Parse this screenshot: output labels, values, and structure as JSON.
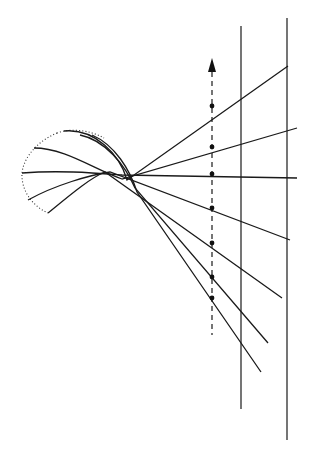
{
  "diagram": {
    "colors": {
      "stroke": "#1a1a1a",
      "background": "#ffffff"
    },
    "source_outline": "M57,133 C40,140 24,155 22,173 C21,190 32,206 48,213 M57,133 C70,128 90,130 104,138",
    "rays": [
      {
        "id": 1,
        "path": "M64,131 C95,128 120,155 127,180 L288,66"
      },
      {
        "id": 2,
        "path": "M34,148 C65,148 95,170 122,179 L297,128"
      },
      {
        "id": 3,
        "path": "M22,173 C60,170 95,173 122,175 L297,178"
      },
      {
        "id": 4,
        "path": "M28,200 C55,185 90,175 110,172 L290,240"
      },
      {
        "id": 5,
        "path": "M48,213 C70,195 90,178 105,172 L282,298"
      },
      {
        "id": 6,
        "path": "M80,135 C105,140 125,165 135,188 L268,343"
      },
      {
        "id": 7,
        "path": "M92,135 C115,145 130,170 137,192 L261,372"
      }
    ],
    "axis": {
      "x": 212,
      "y_top": 60,
      "y_bottom": 335,
      "arrow": "up"
    },
    "dots": [
      {
        "x": 212,
        "y": 106
      },
      {
        "x": 212,
        "y": 147
      },
      {
        "x": 212,
        "y": 174
      },
      {
        "x": 212,
        "y": 208
      },
      {
        "x": 212,
        "y": 243
      },
      {
        "x": 212,
        "y": 277
      },
      {
        "x": 212,
        "y": 298
      }
    ],
    "screens": [
      {
        "x": 241,
        "y_top": 26,
        "y_bottom": 409
      },
      {
        "x": 287,
        "y_top": 18,
        "y_bottom": 440
      }
    ]
  }
}
